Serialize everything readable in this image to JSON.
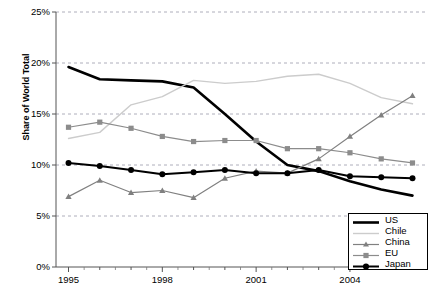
{
  "chart_data": {
    "type": "line",
    "title": "",
    "subtitle": "",
    "xlabel": "",
    "ylabel": "Share of World Total",
    "x": [
      1995,
      1996,
      1997,
      1998,
      1999,
      2000,
      2001,
      2002,
      2003,
      2004,
      2005,
      2006
    ],
    "xlim": [
      1994.6,
      2006.4
    ],
    "ylim": [
      0,
      25
    ],
    "ytick_values": [
      0,
      5,
      10,
      15,
      20,
      25
    ],
    "ytick_labels": [
      "0%",
      "5%",
      "10%",
      "15%",
      "20%",
      "25%"
    ],
    "xtick_values": [
      1995,
      1998,
      2001,
      2004
    ],
    "xtick_labels": [
      "1995",
      "1998",
      "2001",
      "2004"
    ],
    "grid": "horizontal-dashed",
    "legend_position": "bottom-right",
    "series": [
      {
        "name": "US",
        "color": "#000000",
        "marker": "none",
        "width": 2.6,
        "values": [
          19.6,
          18.4,
          18.3,
          18.2,
          17.6,
          15.0,
          12.3,
          10.0,
          9.4,
          8.4,
          7.6,
          7.0
        ]
      },
      {
        "name": "Chile",
        "color": "#cccccc",
        "marker": "none",
        "width": 1.4,
        "values": [
          12.6,
          13.2,
          15.9,
          16.7,
          18.3,
          18.0,
          18.2,
          18.7,
          18.9,
          18.0,
          16.6,
          16.0
        ]
      },
      {
        "name": "China",
        "color": "#808080",
        "marker": "triangle",
        "width": 1.2,
        "values": [
          6.9,
          8.5,
          7.3,
          7.5,
          6.8,
          8.7,
          9.4,
          9.2,
          10.6,
          12.8,
          14.9,
          16.8
        ]
      },
      {
        "name": "EU",
        "color": "#8c8c8c",
        "marker": "square",
        "width": 1.2,
        "values": [
          13.7,
          14.2,
          13.6,
          12.8,
          12.3,
          12.4,
          12.4,
          11.6,
          11.6,
          11.2,
          10.6,
          10.2
        ]
      },
      {
        "name": "Japan",
        "color": "#000000",
        "marker": "circle",
        "width": 2.0,
        "values": [
          10.2,
          9.9,
          9.5,
          9.1,
          9.3,
          9.5,
          9.2,
          9.2,
          9.5,
          8.9,
          8.8,
          8.7
        ]
      }
    ]
  },
  "legend": {
    "items": [
      {
        "label": "US"
      },
      {
        "label": "Chile"
      },
      {
        "label": "China"
      },
      {
        "label": "EU"
      },
      {
        "label": "Japan"
      }
    ]
  }
}
